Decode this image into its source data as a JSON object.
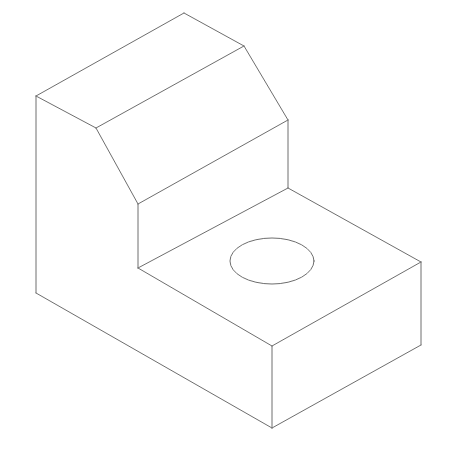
{
  "diagram": {
    "type": "isometric-line-drawing",
    "stroke_color": "#6e6e6e",
    "background": "#ffffff",
    "edges": [
      {
        "id": "top-back-left",
        "x1": 36,
        "y1": 96,
        "x2": 184,
        "y2": 13
      },
      {
        "id": "top-back-right",
        "x1": 184,
        "y1": 13,
        "x2": 244,
        "y2": 46
      },
      {
        "id": "top-front-left",
        "x1": 36,
        "y1": 96,
        "x2": 96,
        "y2": 128
      },
      {
        "id": "top-front-ridge",
        "x1": 96,
        "y1": 128,
        "x2": 244,
        "y2": 46
      },
      {
        "id": "chamfer-left",
        "x1": 96,
        "y1": 128,
        "x2": 138,
        "y2": 204
      },
      {
        "id": "chamfer-right",
        "x1": 244,
        "y1": 46,
        "x2": 288,
        "y2": 120
      },
      {
        "id": "chamfer-bottom",
        "x1": 138,
        "y1": 204,
        "x2": 288,
        "y2": 120
      },
      {
        "id": "step-vertical-left",
        "x1": 138,
        "y1": 204,
        "x2": 138,
        "y2": 268
      },
      {
        "id": "step-vertical-right",
        "x1": 288,
        "y1": 120,
        "x2": 288,
        "y2": 188
      },
      {
        "id": "step-base-left",
        "x1": 138,
        "y1": 268,
        "x2": 288,
        "y2": 188
      },
      {
        "id": "ledge-back-right",
        "x1": 288,
        "y1": 188,
        "x2": 421,
        "y2": 262
      },
      {
        "id": "ledge-front-left",
        "x1": 138,
        "y1": 268,
        "x2": 272,
        "y2": 346
      },
      {
        "id": "ledge-front-right",
        "x1": 272,
        "y1": 346,
        "x2": 421,
        "y2": 262
      },
      {
        "id": "left-vertical",
        "x1": 36,
        "y1": 96,
        "x2": 36,
        "y2": 293
      },
      {
        "id": "bottom-left",
        "x1": 36,
        "y1": 293,
        "x2": 272,
        "y2": 428
      },
      {
        "id": "front-vertical",
        "x1": 272,
        "y1": 346,
        "x2": 272,
        "y2": 428
      },
      {
        "id": "right-vertical",
        "x1": 421,
        "y1": 262,
        "x2": 421,
        "y2": 345
      },
      {
        "id": "bottom-right",
        "x1": 272,
        "y1": 428,
        "x2": 421,
        "y2": 345
      }
    ],
    "hole": {
      "cx": 272,
      "cy": 261,
      "rx": 42,
      "ry": 23
    }
  }
}
